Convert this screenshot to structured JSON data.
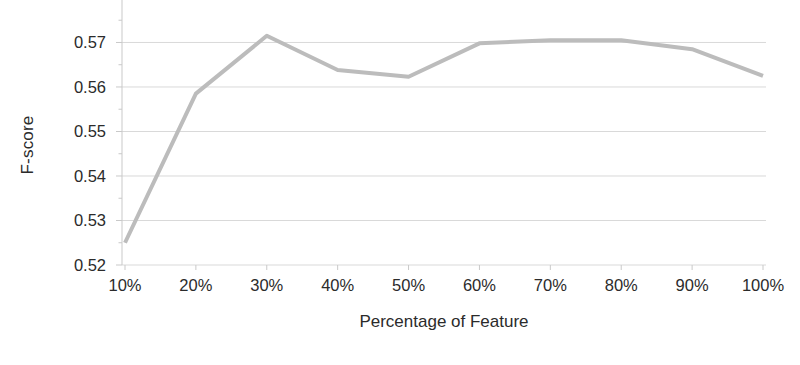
{
  "chart_data": {
    "type": "line",
    "title": "",
    "subtitle": "",
    "xlabel": "Percentage of Feature",
    "ylabel": "F-score",
    "categories": [
      "10%",
      "20%",
      "30%",
      "40%",
      "50%",
      "60%",
      "70%",
      "80%",
      "90%",
      "100%"
    ],
    "values": [
      0.525,
      0.5585,
      0.5715,
      0.5638,
      0.5623,
      0.5698,
      0.5705,
      0.5705,
      0.5685,
      0.5625
    ],
    "series": [
      {
        "name": "F-score",
        "values": [
          0.525,
          0.5585,
          0.5715,
          0.5638,
          0.5623,
          0.5698,
          0.5705,
          0.5705,
          0.5685,
          0.5625
        ]
      }
    ],
    "ylim": [
      0.52,
      0.5755
    ],
    "yticks": [
      0.52,
      0.53,
      0.54,
      0.55,
      0.56,
      0.57
    ],
    "ytick_labels": [
      "0.52",
      "0.53",
      "0.54",
      "0.55",
      "0.56",
      "0.57"
    ],
    "xtick_labels": [
      "10%",
      "20%",
      "30%",
      "40%",
      "50%",
      "60%",
      "70%",
      "80%",
      "90%",
      "100%"
    ],
    "grid": "horizontal",
    "legend": "none",
    "annotations": [],
    "colors": {
      "line": "#bcbcbc",
      "grid": "#d9d9d9",
      "axis": "#c9c9c9",
      "text": "#2b2b2b",
      "background": "#ffffff"
    },
    "line_width": 4
  }
}
